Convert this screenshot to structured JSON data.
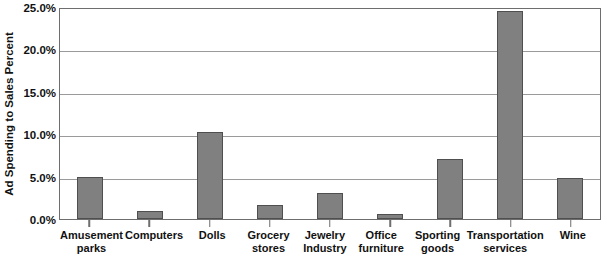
{
  "chart_data": {
    "type": "bar",
    "title": "",
    "xlabel": "",
    "ylabel": "Ad Spending to Sales Percent",
    "ylim": [
      0,
      25
    ],
    "ytick_labels": [
      "25.0%",
      "20.0%",
      "15.0%",
      "10.0%",
      "5.0%",
      "0.0%"
    ],
    "ytick_values": [
      25,
      20,
      15,
      10,
      5,
      0
    ],
    "grid": true,
    "legend": null,
    "categories": [
      "Amusement parks",
      "Computers",
      "Dolls",
      "Grocery stores",
      "Jewelry Industry",
      "Office furniture",
      "Sporting goods",
      "Transportation services",
      "Wine"
    ],
    "category_lines": [
      [
        "Amusement",
        "parks"
      ],
      [
        "Computers"
      ],
      [
        "Dolls"
      ],
      [
        "Grocery",
        "stores"
      ],
      [
        "Jewelry",
        "Industry"
      ],
      [
        "Office",
        "furniture"
      ],
      [
        "Sporting",
        "goods"
      ],
      [
        "Transportation",
        "services"
      ],
      [
        "Wine"
      ]
    ],
    "values": [
      5.0,
      1.0,
      10.3,
      1.7,
      3.1,
      0.6,
      7.1,
      24.5,
      4.8
    ],
    "bar_color": "#808080",
    "bar_border_color": "#4f4f4f",
    "gridline_color": "#9a9a9a",
    "axis_color": "#6e6e6e",
    "background": "#ffffff"
  }
}
